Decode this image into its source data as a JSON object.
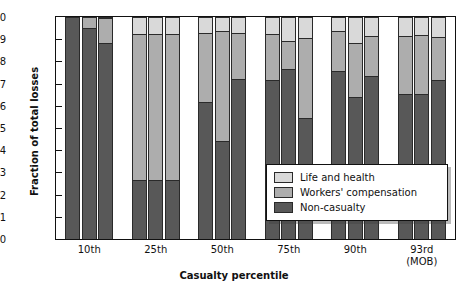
{
  "chart_data": {
    "type": "bar",
    "subtype": "stacked-grouped",
    "title": "",
    "xlabel": "Casualty percentile",
    "ylabel": "Fraction of total losses",
    "ylim": [
      0,
      1.0
    ],
    "ytick_labels": [
      "1.0",
      "0.9",
      "0.8",
      "0.7",
      "0.6",
      "0.5",
      "0.4",
      "0.3",
      "0.2",
      "0.1",
      "0"
    ],
    "ytick_values": [
      1.0,
      0.9,
      0.8,
      0.7,
      0.6,
      0.5,
      0.4,
      0.3,
      0.2,
      0.1,
      0
    ],
    "grid": false,
    "legend_position": "lower-right-inside",
    "categories": [
      "10th",
      "25th",
      "50th",
      "75th",
      "90th",
      "93rd\n(MOB)"
    ],
    "bars_per_category": 3,
    "series": [
      {
        "name": "Life and health",
        "color": "#d9d9d9",
        "values": [
          [
            0.0,
            0.0,
            0.005
          ],
          [
            0.075,
            0.075,
            0.075
          ],
          [
            0.07,
            0.065,
            0.07
          ],
          [
            0.075,
            0.11,
            0.095
          ],
          [
            0.065,
            0.115,
            0.085
          ],
          [
            0.085,
            0.08,
            0.09
          ]
        ]
      },
      {
        "name": "Workers' compensation",
        "color": "#adadad",
        "values": [
          [
            0.0,
            0.05,
            0.11
          ],
          [
            0.66,
            0.66,
            0.66
          ],
          [
            0.315,
            0.495,
            0.21
          ],
          [
            0.21,
            0.125,
            0.36
          ],
          [
            0.18,
            0.245,
            0.18
          ],
          [
            0.26,
            0.265,
            0.195
          ]
        ]
      },
      {
        "name": "Non-casualty",
        "color": "#585858",
        "values": [
          [
            1.0,
            0.95,
            0.885
          ],
          [
            0.265,
            0.265,
            0.265
          ],
          [
            0.615,
            0.44,
            0.72
          ],
          [
            0.715,
            0.765,
            0.545
          ],
          [
            0.755,
            0.64,
            0.735
          ],
          [
            0.655,
            0.655,
            0.715
          ]
        ]
      }
    ]
  },
  "legend": {
    "items": [
      {
        "label": "Life and health",
        "swatch": "sw-life"
      },
      {
        "label": "Workers' compensation",
        "swatch": "sw-wc"
      },
      {
        "label": "Non-casualty",
        "swatch": "sw-nc"
      }
    ]
  }
}
